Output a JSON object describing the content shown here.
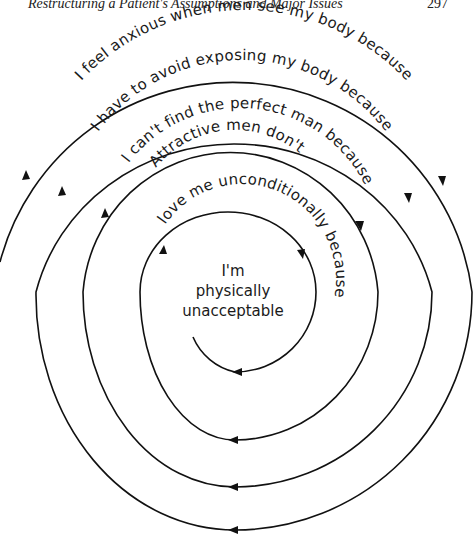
{
  "running_head": {
    "title": "Restructuring a Patient's Assumptions and Major Issues",
    "page_number": "297"
  },
  "diagram": {
    "type": "downward-arrow spiral",
    "levels": [
      {
        "label": "I feel anxious when men see my body because"
      },
      {
        "label": "I have to avoid exposing my body because"
      },
      {
        "label": "I can't find the perfect man because"
      },
      {
        "label_line1": "Attractive men don't",
        "label_line2": "love me unconditionally because"
      }
    ],
    "core_belief": {
      "line1": "I'm",
      "line2": "physically",
      "line3": "unacceptable"
    },
    "line_color": "#111111"
  }
}
